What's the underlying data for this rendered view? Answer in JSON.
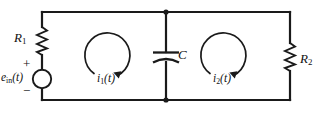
{
  "figure": {
    "background_color": "#ffffff",
    "line_color": "#1a1a1a"
  },
  "components": {
    "resistor_1": {
      "label": "R",
      "subscript": "1",
      "type": "resistor",
      "position": "left-branch-upper"
    },
    "resistor_2": {
      "label": "R",
      "subscript": "2",
      "type": "resistor",
      "position": "right-branch-middle"
    },
    "capacitor": {
      "label": "C",
      "type": "capacitor",
      "position": "center-branch-middle"
    },
    "source": {
      "label": "e",
      "subscript": "in",
      "argument": "(t)",
      "type": "voltage-source",
      "plus_sign": "+",
      "minus_sign": "−",
      "position": "left-branch-lower"
    }
  },
  "mesh_currents": [
    {
      "label": "i",
      "subscript": "1",
      "argument": "(t)",
      "direction": "clockwise",
      "loop": "left"
    },
    {
      "label": "i",
      "subscript": "2",
      "argument": "(t)",
      "direction": "clockwise",
      "loop": "right"
    }
  ]
}
